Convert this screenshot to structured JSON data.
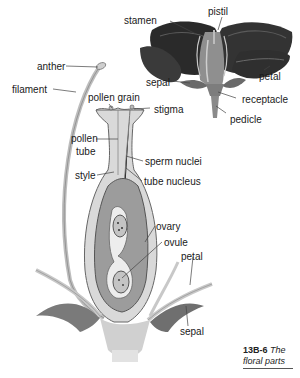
{
  "figure": {
    "number": "13B-6",
    "title": "The floral parts"
  },
  "whole_flower_labels": {
    "stamen": "stamen",
    "pistil": "pistil",
    "petal": "petal",
    "sepal": "sepal",
    "receptacle": "receptacle",
    "pedicle": "pedicle"
  },
  "section_labels": {
    "anther": "anther",
    "filament": "filament",
    "pollen_grain": "pollen grain",
    "stigma": "stigma",
    "pollen_tube_1": "pollen",
    "pollen_tube_2": "tube",
    "sperm_nuclei": "sperm nuclei",
    "style": "style",
    "tube_nucleus": "tube nucleus",
    "ovary": "ovary",
    "ovule": "ovule",
    "petal": "petal",
    "sepal": "sepal"
  },
  "colors": {
    "petal_dark": "#2e2e2e",
    "tissue_light": "#d6d6d6",
    "tissue_mid": "#9a9a9a",
    "leader_line": "#444444"
  }
}
